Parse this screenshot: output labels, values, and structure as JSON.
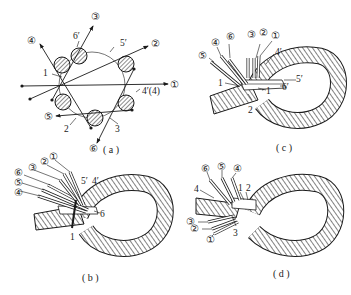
{
  "figure": {
    "panels": [
      {
        "id": "a",
        "caption": "( a )",
        "description": "Cross-section of 6-strand rope with tuck directions",
        "circled_labels": [
          "①",
          "②",
          "③",
          "④",
          "⑤",
          "⑥"
        ],
        "plain_labels": [
          "1",
          "2",
          "3",
          "4′(4)",
          "5′",
          "6′"
        ]
      },
      {
        "id": "b",
        "caption": "( b )",
        "circled_labels": [
          "①",
          "②",
          "③",
          "⑥",
          "⑤",
          "④"
        ],
        "plain_labels": [
          "5′",
          "4′",
          "6",
          "1"
        ]
      },
      {
        "id": "c",
        "caption": "( c )",
        "circled_labels": [
          "⑤",
          "④",
          "⑥",
          "③",
          "②",
          "①"
        ],
        "plain_labels": [
          "4′",
          "5′",
          "6′",
          "1",
          "1",
          "2"
        ]
      },
      {
        "id": "d",
        "caption": "( d )",
        "circled_labels": [
          "⑥",
          "⑤",
          "④",
          "③",
          "②",
          "①"
        ],
        "plain_labels": [
          "4",
          "1",
          "2",
          "3"
        ]
      }
    ]
  },
  "a": {
    "caption": "( a )",
    "c1": "①",
    "c2": "②",
    "c3": "③",
    "c4": "④",
    "c5": "⑤",
    "c6": "⑥",
    "n1": "1",
    "n2": "2",
    "n3": "3",
    "n4": "4′(4)",
    "n5": "5′",
    "n6": "6′"
  },
  "b": {
    "caption": "( b )",
    "c1": "①",
    "c2": "②",
    "c3": "③",
    "c4": "④",
    "c5": "⑤",
    "c6": "⑥",
    "n5": "5′",
    "n4": "4′",
    "n6": "6",
    "n1": "1"
  },
  "c": {
    "caption": "( c )",
    "c1": "①",
    "c2": "②",
    "c3": "③",
    "c4": "④",
    "c5": "⑤",
    "c6": "⑥",
    "n4": "4′",
    "n5": "5′",
    "n6": "6′",
    "n1a": "1",
    "n1b": "1",
    "n2": "2"
  },
  "d": {
    "caption": "( d )",
    "c1": "①",
    "c2": "②",
    "c3": "③",
    "c4": "④",
    "c5": "⑤",
    "c6": "⑥",
    "n4": "4",
    "n1": "1",
    "n2": "2",
    "n3": "3"
  }
}
